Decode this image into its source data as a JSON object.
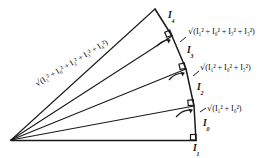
{
  "figure": {
    "type": "geometric-diagram",
    "name": "spiral-of-theodorus",
    "apex": {
      "x": 11,
      "y": 140
    },
    "line_color": "#1a1a1a",
    "background_color": "#ffffff",
    "vertices": [
      {
        "name": "apex",
        "x": 11,
        "y": 140
      },
      {
        "name": "v1",
        "x": 196,
        "y": 140
      },
      {
        "name": "v2",
        "x": 194,
        "y": 106
      },
      {
        "name": "v3",
        "x": 186,
        "y": 69
      },
      {
        "name": "v4",
        "x": 172,
        "y": 36
      },
      {
        "name": "v5",
        "x": 155,
        "y": 9
      }
    ],
    "legs": [
      {
        "name": "I1",
        "from": "apex",
        "to": "v1"
      },
      {
        "name": "I0",
        "from": "v1",
        "to": "v2"
      },
      {
        "name": "I2",
        "from": "v2",
        "to": "v3"
      },
      {
        "name": "I3",
        "from": "v3",
        "to": "v4"
      },
      {
        "name": "I4",
        "from": "v4",
        "to": "v5"
      }
    ],
    "hypotenuses": [
      {
        "name": "h1",
        "from": "apex",
        "to": "v2"
      },
      {
        "name": "h2",
        "from": "apex",
        "to": "v3"
      },
      {
        "name": "h3",
        "from": "apex",
        "to": "v4"
      },
      {
        "name": "h4",
        "from": "apex",
        "to": "v5"
      }
    ],
    "right_angle_markers": [
      {
        "at": "v1",
        "x": 196,
        "y": 140
      },
      {
        "at": "v2",
        "x": 194,
        "y": 106
      },
      {
        "at": "v3",
        "x": 186,
        "y": 69
      },
      {
        "at": "v4",
        "x": 172,
        "y": 36
      }
    ]
  },
  "labels": {
    "leg_I1": {
      "base": "I",
      "sub": "1"
    },
    "leg_I0": {
      "base": "I",
      "sub": "0"
    },
    "leg_I2": {
      "base": "I",
      "sub": "2"
    },
    "leg_I3": {
      "base": "I",
      "sub": "3"
    },
    "leg_I4": {
      "base": "I",
      "sub": "4"
    },
    "radical_symbol": "√",
    "hyp_1_text": "(I₁² + I₀²)",
    "hyp_2_text": "(I₁² + I₀² + I₂²)",
    "hyp_3_text": "(I₁² + I₀² + I₂² + I₃²)",
    "hyp_4_text": "(I₁² + I₀² + I₂² + I₃² + I₄²)",
    "hyp_1_full": "√(I₁² + I₀²)",
    "hyp_2_full": "√(I₁² + I₀² + I₂²)",
    "hyp_3_full": "√(I₁² + I₀² + I₂² + I₃²)",
    "hyp_4_full": "√(I₁² + I₀² + I₂² + I₃² + I₄²)"
  }
}
